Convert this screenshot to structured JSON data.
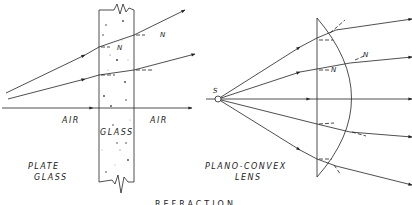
{
  "title": "REFRACTION",
  "plate_glass": {
    "caption_line1": "PLATE",
    "caption_line2": "GLASS",
    "left_medium": "AIR",
    "middle_medium": "GLASS",
    "right_medium": "AIR",
    "normal_label_1": "N",
    "normal_label_2": "N"
  },
  "lens": {
    "caption_line1": "PLANO-CONVEX",
    "caption_line2": "LENS",
    "source_label": "S",
    "normal_label_1": "N",
    "normal_label_2": "N"
  },
  "colors": {
    "ink": "#222222",
    "background": "#ffffff"
  }
}
